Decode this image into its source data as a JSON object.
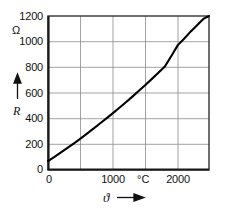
{
  "chart_data": {
    "type": "line",
    "title": "",
    "subtitle": "",
    "xlabel": "ϑ",
    "ylabel": "R",
    "x_unit": "°C",
    "y_unit": "Ω",
    "xlim": [
      0,
      2480
    ],
    "ylim": [
      0,
      1200
    ],
    "grid": true,
    "legend": false,
    "x_ticks": [
      0,
      1000,
      2000
    ],
    "x_tick_labels": [
      "0",
      "1000",
      "2000"
    ],
    "x_gridlines": [
      0,
      500,
      1000,
      1500,
      2000
    ],
    "y_ticks": [
      0,
      200,
      400,
      600,
      800,
      1000,
      1200
    ],
    "y_tick_labels": [
      "0",
      "200",
      "400",
      "600",
      "800",
      "1000",
      "1200"
    ],
    "y_gridlines": [
      0,
      200,
      400,
      600,
      800,
      1000,
      1200
    ],
    "series": [
      {
        "name": "R(ϑ)",
        "x": [
          0,
          100,
          200,
          300,
          400,
          500,
          600,
          700,
          800,
          900,
          1000,
          1100,
          1200,
          1300,
          1400,
          1500,
          1600,
          1700,
          1800,
          1900,
          2000,
          2100,
          2200,
          2300,
          2400,
          2480
        ],
        "values": [
          70,
          103,
          137,
          172,
          208,
          245,
          283,
          322,
          362,
          402,
          443,
          485,
          528,
          572,
          617,
          663,
          710,
          758,
          807,
          888,
          973,
          1025,
          1080,
          1130,
          1180,
          1200
        ]
      }
    ],
    "annotations": []
  },
  "axes": {
    "y": {
      "unit": "Ω",
      "variable": "R",
      "tick_labels": [
        "1200",
        "1000",
        "800",
        "600",
        "400",
        "200",
        "0"
      ],
      "arrow": "up-arrow"
    },
    "x": {
      "unit": "°C",
      "variable": "ϑ",
      "tick_labels": [
        "0",
        "1000",
        "2000"
      ],
      "arrow": "right-arrow"
    }
  },
  "colors": {
    "curve": "#000000",
    "grid": "#8c8c8c",
    "frame": "#333333",
    "text": "#111111",
    "background": "#ffffff"
  }
}
